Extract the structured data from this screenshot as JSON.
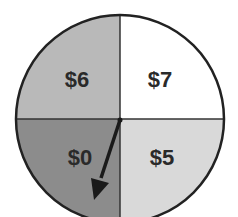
{
  "spinner": {
    "sections": [
      {
        "id": "top-left",
        "label": "$6",
        "color": "#b9b9b9"
      },
      {
        "id": "top-right",
        "label": "$7",
        "color": "#ffffff"
      },
      {
        "id": "bottom-left",
        "label": "$0",
        "color": "#8c8c8c"
      },
      {
        "id": "bottom-right",
        "label": "$5",
        "color": "#d9d9d9"
      }
    ],
    "pointer": {
      "points_to": "$0"
    }
  }
}
